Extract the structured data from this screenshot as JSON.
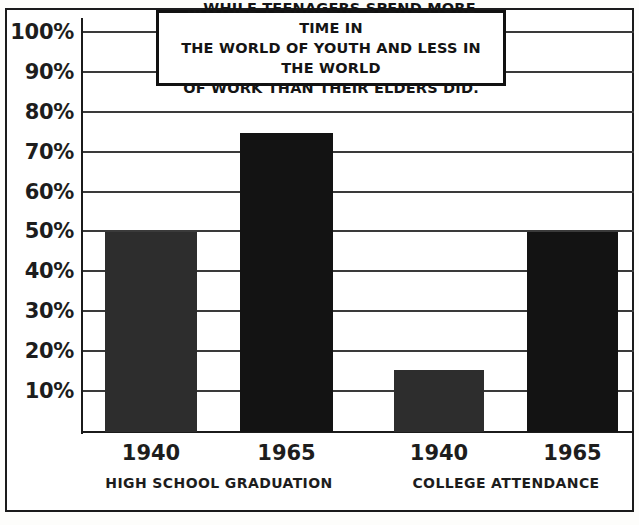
{
  "caption": {
    "lines": [
      "...WHILE TEENAGERS SPEND MORE TIME IN",
      "THE WORLD OF YOUTH AND LESS IN THE WORLD",
      "OF WORK THAN THEIR ELDERS DID."
    ]
  },
  "chart_data": {
    "type": "bar",
    "title": "",
    "xlabel": "",
    "ylabel": "",
    "ylim": [
      0,
      105
    ],
    "grid": true,
    "legend": "none",
    "ytick_labels": [
      "100%",
      "90%",
      "80%",
      "70%",
      "60%",
      "50%",
      "40%",
      "30%",
      "20%",
      "10%"
    ],
    "ytick_values": [
      100,
      90,
      80,
      70,
      60,
      50,
      40,
      30,
      20,
      10
    ],
    "categories": [
      "1940",
      "1965",
      "1940",
      "1965"
    ],
    "values": [
      50,
      75,
      15.5,
      50
    ],
    "groups": [
      {
        "label": "HIGH SCHOOL GRADUATION",
        "categories": [
          "1940",
          "1965"
        ],
        "values": [
          50,
          75
        ]
      },
      {
        "label": "COLLEGE ATTENDANCE",
        "categories": [
          "1940",
          "1965"
        ],
        "values": [
          15.5,
          50
        ]
      }
    ],
    "bar_colors": [
      "#2d2d2d",
      "#131313",
      "#2d2d2d",
      "#131313"
    ],
    "axis_color": "#1b1b1b",
    "grid_color": "#3a3a3a",
    "background": "#ffffff"
  }
}
